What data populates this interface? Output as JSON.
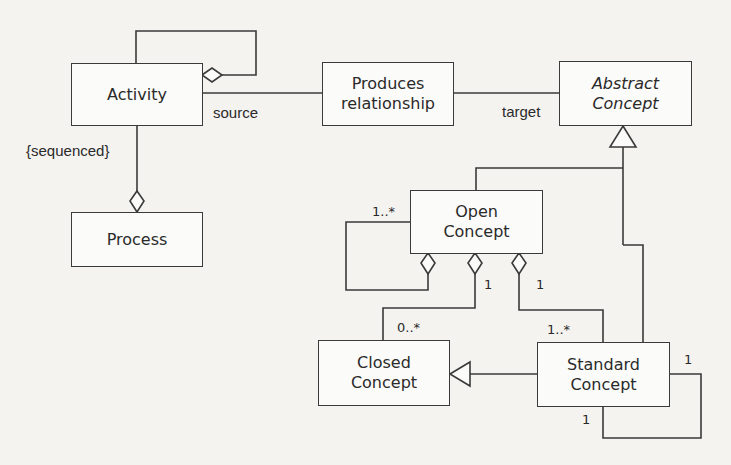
{
  "diagram": {
    "type": "UML class diagram",
    "classes": {
      "activity": {
        "label": "Activity"
      },
      "produces": {
        "label": "Produces\nrelationship"
      },
      "abstract": {
        "label": "Abstract\nConcept",
        "abstract": true
      },
      "process": {
        "label": "Process"
      },
      "open": {
        "label": "Open\nConcept"
      },
      "closed": {
        "label": "Closed\nConcept"
      },
      "standard": {
        "label": "Standard\nConcept"
      }
    },
    "labels": {
      "source": "source",
      "target": "target",
      "sequenced": "{sequenced}",
      "open_self_mult": "1..*",
      "open_closed_owner_mult": "1",
      "open_closed_part_mult": "0..*",
      "open_standard_owner_mult": "1",
      "open_standard_part_mult": "1..*",
      "standard_self_mult_right": "1",
      "standard_self_mult_bottom": "1"
    },
    "relationships": [
      {
        "from": "Activity",
        "to": "Activity",
        "kind": "aggregation",
        "note": "self"
      },
      {
        "from": "Activity",
        "to": "Produces relationship",
        "kind": "association",
        "role": "source"
      },
      {
        "from": "Produces relationship",
        "to": "Abstract Concept",
        "kind": "association",
        "role": "target"
      },
      {
        "from": "Process",
        "to": "Activity",
        "kind": "aggregation",
        "constraint": "{sequenced}"
      },
      {
        "from": "Open Concept",
        "to": "Abstract Concept",
        "kind": "generalization"
      },
      {
        "from": "Standard Concept",
        "to": "Abstract Concept",
        "kind": "generalization"
      },
      {
        "from": "Standard Concept",
        "to": "Closed Concept",
        "kind": "generalization"
      },
      {
        "from": "Open Concept",
        "to": "Open Concept",
        "kind": "aggregation",
        "multiplicity": "1..*"
      },
      {
        "from": "Open Concept",
        "to": "Closed Concept",
        "kind": "aggregation",
        "multiplicity": [
          "1",
          "0..*"
        ]
      },
      {
        "from": "Open Concept",
        "to": "Standard Concept",
        "kind": "aggregation",
        "multiplicity": [
          "1",
          "1..*"
        ]
      },
      {
        "from": "Standard Concept",
        "to": "Standard Concept",
        "kind": "association",
        "multiplicity": [
          "1",
          "1"
        ]
      }
    ],
    "colors": {
      "line": "#3a3a3a",
      "background": "#f4f3f0",
      "box_fill": "#fbfbf9"
    }
  }
}
